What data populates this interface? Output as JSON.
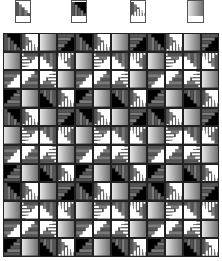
{
  "legend": {
    "tiles": [
      {
        "name": "stairs-white",
        "type": "A",
        "x": 15
      },
      {
        "name": "stairs-black",
        "type": "B",
        "x": 71
      },
      {
        "name": "white-stairs",
        "type": "C",
        "x": 130
      },
      {
        "name": "gradient",
        "type": "D",
        "x": 187
      }
    ]
  },
  "colors": {
    "black": "#000000",
    "dark_grey": "#555555",
    "mid_grey": "#7a7a7a",
    "white": "#ffffff",
    "gradient_light": "#e6e6e6",
    "gradient_dark": "#707070"
  },
  "quilt": {
    "cols": 12,
    "rows": 12,
    "pattern": [
      [
        "B0",
        "C0",
        "D0",
        "B1"
      ],
      [
        "D0",
        "C1",
        "A2",
        "C2"
      ],
      [
        "A1",
        "A3",
        "C3",
        "D0"
      ],
      [
        "B3",
        "D0",
        "B2",
        "C0"
      ]
    ]
  }
}
